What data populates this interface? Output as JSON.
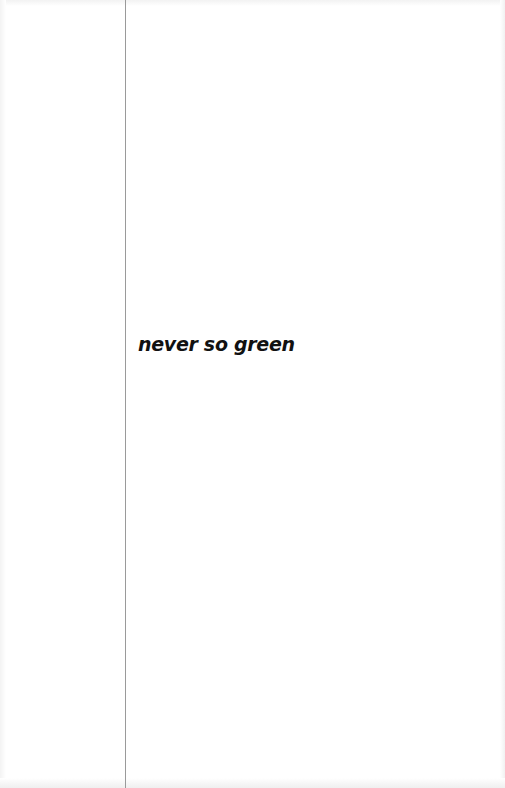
{
  "page": {
    "title": "never so green",
    "colors": {
      "background": "#ffffff",
      "text": "#111111",
      "rule": "#9a9a9a"
    }
  }
}
